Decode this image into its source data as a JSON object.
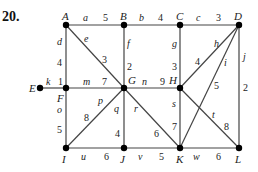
{
  "problem_number": "20.",
  "colors": {
    "edge": "#444444",
    "node": "#000000",
    "text": "#222222"
  },
  "nodes": [
    {
      "id": "A",
      "x": 66,
      "y": 25,
      "lx": 62,
      "ly": 20
    },
    {
      "id": "B",
      "x": 124,
      "y": 25,
      "lx": 120,
      "ly": 20
    },
    {
      "id": "C",
      "x": 180,
      "y": 25,
      "lx": 176,
      "ly": 20
    },
    {
      "id": "D",
      "x": 239,
      "y": 25,
      "lx": 234,
      "ly": 20
    },
    {
      "id": "E",
      "x": 40,
      "y": 88,
      "lx": 29,
      "ly": 92
    },
    {
      "id": "F",
      "x": 66,
      "y": 88,
      "lx": 57,
      "ly": 102
    },
    {
      "id": "G",
      "x": 124,
      "y": 88,
      "lx": 128,
      "ly": 84
    },
    {
      "id": "H",
      "x": 180,
      "y": 88,
      "lx": 169,
      "ly": 84
    },
    {
      "id": "I",
      "x": 66,
      "y": 148,
      "lx": 62,
      "ly": 163
    },
    {
      "id": "J",
      "x": 124,
      "y": 148,
      "lx": 120,
      "ly": 163
    },
    {
      "id": "K",
      "x": 180,
      "y": 148,
      "lx": 176,
      "ly": 163
    },
    {
      "id": "L",
      "x": 239,
      "y": 148,
      "lx": 235,
      "ly": 163
    }
  ],
  "edges": [
    {
      "name": "a",
      "from": "A",
      "to": "B",
      "weight": "5",
      "nx": 83,
      "ny": 21,
      "wx": 103,
      "wy": 21
    },
    {
      "name": "b",
      "from": "B",
      "to": "C",
      "weight": "4",
      "nx": 139,
      "ny": 21,
      "wx": 158,
      "wy": 21
    },
    {
      "name": "c",
      "from": "C",
      "to": "D",
      "weight": "3",
      "nx": 196,
      "ny": 21,
      "wx": 216,
      "wy": 21
    },
    {
      "name": "d",
      "from": "A",
      "to": "F",
      "weight": "4",
      "nx": 57,
      "ny": 45,
      "wx": 57,
      "wy": 66
    },
    {
      "name": "e",
      "from": "A",
      "to": "G",
      "weight": "3",
      "nx": 84,
      "ny": 42,
      "wx": 102,
      "wy": 63
    },
    {
      "name": "f",
      "from": "B",
      "to": "G",
      "weight": "2",
      "nx": 127,
      "ny": 47,
      "wx": 127,
      "wy": 70
    },
    {
      "name": "g",
      "from": "C",
      "to": "H",
      "weight": "3",
      "nx": 172,
      "ny": 47,
      "wx": 172,
      "wy": 70
    },
    {
      "name": "h",
      "from": "D",
      "to": "H",
      "weight": "4",
      "nx": 214,
      "ny": 47,
      "wx": 195,
      "wy": 65
    },
    {
      "name": "i",
      "from": "D",
      "to": "K",
      "weight": "5",
      "nx": 224,
      "ny": 66,
      "wx": 214,
      "wy": 89
    },
    {
      "name": "j",
      "from": "D",
      "to": "L",
      "weight": "2",
      "nx": 243,
      "ny": 60,
      "wx": 243,
      "wy": 91
    },
    {
      "name": "k",
      "from": "E",
      "to": "F",
      "weight": "1",
      "nx": 46,
      "ny": 85,
      "wx": 58,
      "wy": 85
    },
    {
      "name": "m",
      "from": "F",
      "to": "G",
      "weight": "7",
      "nx": 83,
      "ny": 85,
      "wx": 102,
      "wy": 85
    },
    {
      "name": "n",
      "from": "G",
      "to": "H",
      "weight": "9",
      "nx": 142,
      "ny": 85,
      "wx": 160,
      "wy": 85
    },
    {
      "name": "o",
      "from": "F",
      "to": "I",
      "weight": "5",
      "nx": 57,
      "ny": 113,
      "wx": 57,
      "wy": 133
    },
    {
      "name": "p",
      "from": "G",
      "to": "I",
      "weight": "8",
      "nx": 98,
      "ny": 104,
      "wx": 84,
      "wy": 121
    },
    {
      "name": "q",
      "from": "G",
      "to": "J",
      "weight": "4",
      "nx": 114,
      "ny": 112,
      "wx": 115,
      "wy": 137
    },
    {
      "name": "r",
      "from": "G",
      "to": "K",
      "weight": "6",
      "nx": 134,
      "ny": 112,
      "wx": 154,
      "wy": 137
    },
    {
      "name": "s",
      "from": "H",
      "to": "K",
      "weight": "7",
      "nx": 172,
      "ny": 107,
      "wx": 172,
      "wy": 130
    },
    {
      "name": "t",
      "from": "H",
      "to": "L",
      "weight": "8",
      "nx": 212,
      "ny": 118,
      "wx": 224,
      "wy": 130
    },
    {
      "name": "u",
      "from": "I",
      "to": "J",
      "weight": "6",
      "nx": 81,
      "ny": 160,
      "wx": 104,
      "wy": 160
    },
    {
      "name": "v",
      "from": "J",
      "to": "K",
      "weight": "5",
      "nx": 138,
      "ny": 160,
      "wx": 159,
      "wy": 160
    },
    {
      "name": "w",
      "from": "K",
      "to": "L",
      "weight": "6",
      "nx": 193,
      "ny": 160,
      "wx": 216,
      "wy": 160
    }
  ]
}
